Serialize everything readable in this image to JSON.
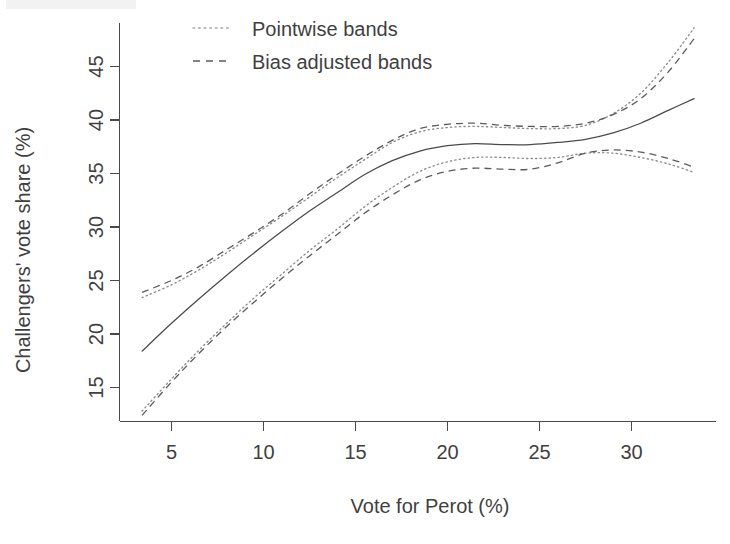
{
  "chart_data": {
    "type": "line",
    "title": "",
    "xlabel": "Vote for Perot (%)",
    "ylabel": "Challengers' vote share (%)",
    "xlim": [
      2.5,
      33.8
    ],
    "ylim": [
      12.5,
      49.5
    ],
    "xticks": [
      5,
      10,
      15,
      20,
      25,
      30
    ],
    "yticks": [
      15,
      20,
      25,
      30,
      35,
      40,
      45
    ],
    "xtick_labels": [
      "5",
      "10",
      "15",
      "20",
      "25",
      "30"
    ],
    "ytick_labels": [
      "15",
      "20",
      "25",
      "30",
      "35",
      "40",
      "45"
    ],
    "grid": false,
    "legend_position": "top-center",
    "legend": [
      {
        "label": "Pointwise bands",
        "style": "dotted"
      },
      {
        "label": "Bias adjusted bands",
        "style": "dashed"
      }
    ],
    "x": [
      3.4,
      5.0,
      6.5,
      8.0,
      9.5,
      11.0,
      12.5,
      14.0,
      15.5,
      17.0,
      18.5,
      20.0,
      21.5,
      23.0,
      24.5,
      26.0,
      27.5,
      29.0,
      30.5,
      32.0,
      33.4
    ],
    "series": [
      {
        "name": "Fitted curve",
        "style": "solid",
        "values": [
          18.4,
          21.0,
          23.3,
          25.5,
          27.6,
          29.6,
          31.5,
          33.2,
          34.9,
          36.2,
          37.1,
          37.6,
          37.8,
          37.7,
          37.7,
          37.9,
          38.2,
          38.8,
          39.7,
          40.9,
          42.0
        ]
      },
      {
        "name": "Pointwise band upper",
        "style": "dotted",
        "values": [
          23.4,
          24.6,
          26.0,
          27.6,
          29.3,
          31.0,
          32.8,
          34.6,
          36.3,
          37.9,
          38.9,
          39.3,
          39.4,
          39.3,
          39.2,
          39.2,
          39.5,
          40.6,
          42.5,
          45.4,
          48.6
        ]
      },
      {
        "name": "Pointwise band lower",
        "style": "dotted",
        "values": [
          12.8,
          15.8,
          18.5,
          21.0,
          23.4,
          25.6,
          27.8,
          29.8,
          31.9,
          33.7,
          35.2,
          36.1,
          36.5,
          36.5,
          36.4,
          36.5,
          36.9,
          36.9,
          36.5,
          35.9,
          35.1
        ]
      },
      {
        "name": "Bias adjusted band upper",
        "style": "dashed",
        "values": [
          23.9,
          25.0,
          26.3,
          27.9,
          29.5,
          31.2,
          33.1,
          34.9,
          36.6,
          38.1,
          39.2,
          39.6,
          39.7,
          39.5,
          39.4,
          39.4,
          39.7,
          40.5,
          42.0,
          44.5,
          47.6
        ]
      },
      {
        "name": "Bias adjusted band lower",
        "style": "dashed",
        "values": [
          12.4,
          15.5,
          18.2,
          20.7,
          23.0,
          25.2,
          27.3,
          29.3,
          31.3,
          33.0,
          34.4,
          35.2,
          35.5,
          35.4,
          35.4,
          36.0,
          36.9,
          37.2,
          37.0,
          36.4,
          35.6
        ]
      }
    ]
  },
  "axes": {
    "x_title": "Vote for Perot (%)",
    "y_title": "Challengers' vote share (%)",
    "x_ticks": [
      "5",
      "10",
      "15",
      "20",
      "25",
      "30"
    ],
    "y_ticks": [
      "15",
      "20",
      "25",
      "30",
      "35",
      "40",
      "45"
    ]
  },
  "legend": {
    "pointwise_label": "Pointwise bands",
    "bias_label": "Bias adjusted bands"
  },
  "colors": {
    "fit_line": "#4a4a4a",
    "pointwise": "#8c8c8c",
    "bias": "#5c5c5c",
    "axis": "#4a4a4a",
    "text": "#3f3f3f",
    "background": "#ffffff"
  }
}
